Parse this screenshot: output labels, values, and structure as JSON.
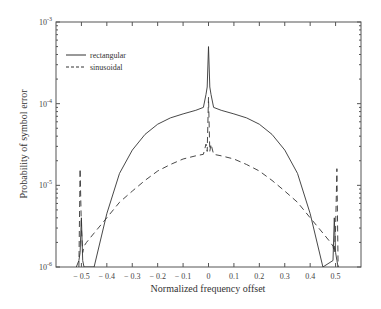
{
  "chart_data": {
    "type": "line",
    "title": "",
    "xlabel": "Normalized frequency offset",
    "ylabel": "Probability of symbol error",
    "xlim": [
      -0.6,
      0.6
    ],
    "ylim": [
      1e-06,
      0.001
    ],
    "yscale": "log",
    "grid": false,
    "legend_position": "upper left",
    "x_ticks": [
      -0.5,
      -0.4,
      -0.3,
      -0.2,
      -0.1,
      0,
      0.1,
      0.2,
      0.3,
      0.4,
      0.5
    ],
    "x_tick_labels": [
      "-0.5",
      "-0.4",
      "-0.3",
      "-0.2",
      "-0.1",
      "0",
      "0.1",
      "0.2",
      "0.3",
      "0.4",
      "0.5"
    ],
    "y_ticks": [
      1e-06,
      1e-05,
      0.0001,
      0.001
    ],
    "y_tick_labels": [
      {
        "base": "10",
        "exp": "-6"
      },
      {
        "base": "10",
        "exp": "-5"
      },
      {
        "base": "10",
        "exp": "-4"
      },
      {
        "base": "10",
        "exp": "-3"
      }
    ],
    "series": [
      {
        "name": "rectangular",
        "style": "solid",
        "x": [
          -0.52,
          -0.51,
          -0.505,
          -0.5,
          -0.495,
          -0.49,
          -0.45,
          -0.4,
          -0.35,
          -0.3,
          -0.25,
          -0.2,
          -0.15,
          -0.1,
          -0.05,
          -0.02,
          -0.01,
          -0.005,
          0,
          0.005,
          0.01,
          0.02,
          0.05,
          0.1,
          0.15,
          0.2,
          0.25,
          0.3,
          0.35,
          0.4,
          0.45,
          0.49,
          0.495,
          0.5,
          0.505,
          0.51
        ],
        "values": [
          1e-06,
          1.2e-06,
          1.5e-06,
          4e-06,
          1.2e-06,
          1e-06,
          1e-06,
          4.5e-06,
          1.4e-05,
          2.7e-05,
          4.2e-05,
          5.6e-05,
          6.7e-05,
          7.5e-05,
          8.3e-05,
          9e-05,
          0.00013,
          0.00016,
          0.0005,
          0.00016,
          0.00013,
          9e-05,
          8.3e-05,
          7.5e-05,
          6.7e-05,
          5.6e-05,
          4.2e-05,
          2.7e-05,
          1.4e-05,
          4.5e-06,
          1e-06,
          1.2e-06,
          4e-06,
          1.5e-06,
          1.2e-06,
          1e-06
        ]
      },
      {
        "name": "sinusoidal",
        "style": "dashed",
        "x": [
          -0.51,
          -0.505,
          -0.5,
          -0.495,
          -0.49,
          -0.48,
          -0.45,
          -0.4,
          -0.35,
          -0.3,
          -0.25,
          -0.2,
          -0.15,
          -0.1,
          -0.05,
          -0.02,
          -0.01,
          -0.005,
          0,
          0.005,
          0.01,
          0.02,
          0.05,
          0.1,
          0.15,
          0.2,
          0.25,
          0.3,
          0.35,
          0.4,
          0.45,
          0.48,
          0.49,
          0.495,
          0.5,
          0.505,
          0.51
        ],
        "values": [
          1e-06,
          1.6e-05,
          3e-06,
          1.5e-06,
          1.8e-06,
          2e-06,
          2.6e-06,
          4e-06,
          6.2e-06,
          8.5e-06,
          1.15e-05,
          1.5e-05,
          1.8e-05,
          2.1e-05,
          2.3e-05,
          2.4e-05,
          3.2e-05,
          2.6e-05,
          0.00012,
          2.6e-05,
          3.2e-05,
          2.4e-05,
          2.3e-05,
          2.1e-05,
          1.8e-05,
          1.5e-05,
          1.15e-05,
          8.5e-06,
          6.2e-06,
          4e-06,
          2.6e-06,
          2e-06,
          1.8e-06,
          1.5e-06,
          3e-06,
          1.6e-05,
          1e-06
        ]
      }
    ]
  },
  "legend": [
    {
      "label": "rectangular",
      "style": "solid"
    },
    {
      "label": "sinusoidal",
      "style": "dashed"
    }
  ],
  "axes": {
    "xlabel": "Normalized frequency offset",
    "ylabel": "Probability of symbol error"
  },
  "colors": {
    "line": "#333333",
    "axis": "#555555"
  }
}
